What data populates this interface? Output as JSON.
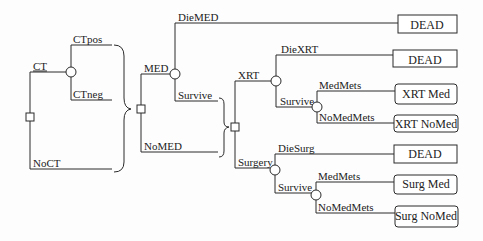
{
  "diagram": {
    "type": "decision-tree",
    "branches": {
      "ct": "CT",
      "no_ct": "NoCT",
      "ct_pos": "CTpos",
      "ct_neg": "CTneg",
      "med": "MED",
      "no_med": "NoMED",
      "die_med": "DieMED",
      "survive_med": "Survive",
      "xrt": "XRT",
      "surgery": "Surgery",
      "die_xrt": "DieXRT",
      "survive_xrt": "Survive",
      "xrt_med_mets": "MedMets",
      "xrt_no_med_mets": "NoMedMets",
      "die_surg": "DieSurg",
      "survive_surg": "Survive",
      "surg_med_mets": "MedMets",
      "surg_no_med_mets": "NoMedMets"
    },
    "outcomes": {
      "dead_med": "DEAD",
      "dead_xrt": "DEAD",
      "xrt_med": "XRT Med",
      "xrt_nomed": "XRT NoMed",
      "dead_surg": "DEAD",
      "surg_med": "Surg Med",
      "surg_nomed": "Surg NoMed"
    }
  }
}
